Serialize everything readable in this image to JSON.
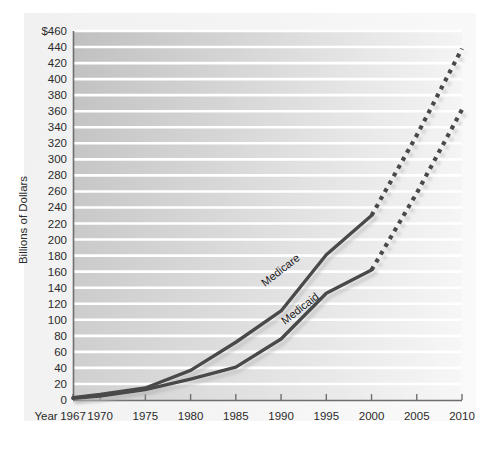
{
  "chart_data": {
    "type": "line",
    "title": "",
    "xlabel": "Year",
    "ylabel": "Billions of Dollars",
    "x_caption": "Year",
    "xlim": [
      1967,
      2010
    ],
    "ylim": [
      0,
      460
    ],
    "grid": true,
    "legend_position": "inline-labels",
    "x_tick_labels": [
      "1967",
      "1970",
      "1975",
      "1980",
      "1985",
      "1990",
      "1995",
      "2000",
      "2005",
      "2010"
    ],
    "x_ticks": [
      1967,
      1970,
      1975,
      1980,
      1985,
      1990,
      1995,
      2000,
      2005,
      2010
    ],
    "y_ticks": [
      0,
      20,
      40,
      60,
      80,
      100,
      120,
      140,
      160,
      180,
      200,
      220,
      240,
      260,
      280,
      300,
      320,
      340,
      360,
      380,
      400,
      420,
      440,
      460
    ],
    "y_tick_labels": [
      "0",
      "20",
      "40",
      "60",
      "80",
      "100",
      "120",
      "140",
      "160",
      "180",
      "200",
      "220",
      "240",
      "260",
      "280",
      "300",
      "320",
      "340",
      "360",
      "380",
      "400",
      "420",
      "440",
      "$460"
    ],
    "y_axis_top_label": "$460",
    "series": [
      {
        "name": "Medicare",
        "label": "Medicare",
        "color": "#4a4a4a",
        "x": [
          1967,
          1970,
          1975,
          1980,
          1985,
          1990,
          1995,
          2000
        ],
        "values": [
          3,
          7,
          15,
          37,
          72,
          111,
          181,
          230
        ],
        "projected": true,
        "projection_x": [
          2000,
          2005,
          2010
        ],
        "projection_values": [
          230,
          330,
          438
        ],
        "style": "solid-then-dotted"
      },
      {
        "name": "Medicaid",
        "label": "Medicaid",
        "color": "#4a4a4a",
        "x": [
          1967,
          1970,
          1975,
          1980,
          1985,
          1990,
          1995,
          2000
        ],
        "values": [
          2,
          5,
          13,
          26,
          41,
          76,
          133,
          162
        ],
        "projected": true,
        "projection_x": [
          2000,
          2005,
          2010
        ],
        "projection_values": [
          162,
          258,
          362
        ],
        "style": "solid-then-dotted"
      }
    ]
  }
}
